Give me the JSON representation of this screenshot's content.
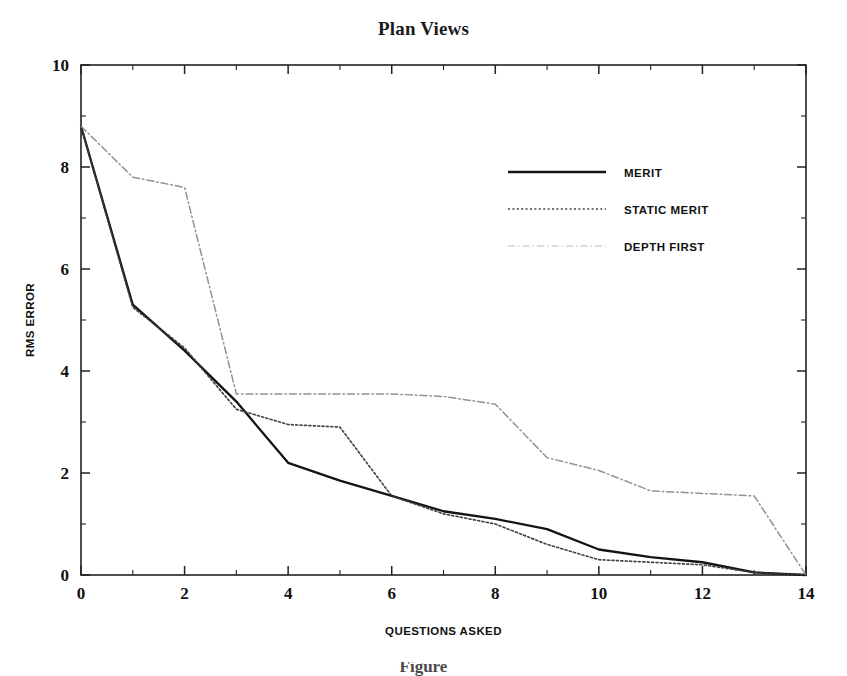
{
  "figure": {
    "title": "Plan Views",
    "caption_partial": "Figure"
  },
  "axes": {
    "x": {
      "label": "QUESTIONS ASKED",
      "ticks": [
        0,
        2,
        4,
        6,
        8,
        10,
        12,
        14
      ],
      "minor_ticks": [
        1,
        3,
        5,
        7,
        9,
        11,
        13
      ],
      "min": 0,
      "max": 14
    },
    "y": {
      "label": "RMS ERROR",
      "ticks": [
        0,
        2,
        4,
        6,
        8,
        10
      ],
      "min": 0,
      "max": 10
    }
  },
  "legend": {
    "position": "upper-right-inside",
    "entries": [
      {
        "label": "MERIT",
        "style": "solid"
      },
      {
        "label": "STATIC MERIT",
        "style": "dotted"
      },
      {
        "label": "DEPTH FIRST",
        "style": "dashdot-faded"
      }
    ]
  },
  "colors": {
    "axis": "#222222",
    "merit": "#141414",
    "static_merit": "#3a3a3a",
    "depth_first": "#8c8c8c",
    "background": "#ffffff"
  },
  "chart_data": {
    "type": "line",
    "title": "Plan Views",
    "xlabel": "QUESTIONS ASKED",
    "ylabel": "RMS ERROR",
    "xlim": [
      0,
      14
    ],
    "ylim": [
      0,
      10
    ],
    "grid": false,
    "legend_position": "upper right",
    "x": [
      0,
      1,
      2,
      3,
      4,
      5,
      6,
      7,
      8,
      9,
      10,
      11,
      12,
      13,
      14
    ],
    "series": [
      {
        "name": "MERIT",
        "style": "solid",
        "values": [
          8.8,
          5.3,
          4.4,
          3.4,
          2.2,
          1.85,
          1.55,
          1.25,
          1.1,
          0.9,
          0.5,
          0.35,
          0.25,
          0.05,
          0.0
        ]
      },
      {
        "name": "STATIC MERIT",
        "style": "dotted",
        "values": [
          8.8,
          5.25,
          4.45,
          3.25,
          2.95,
          2.9,
          1.55,
          1.2,
          1.0,
          0.6,
          0.3,
          0.25,
          0.2,
          0.05,
          0.0
        ]
      },
      {
        "name": "DEPTH FIRST",
        "style": "dashdot",
        "values": [
          8.8,
          7.8,
          7.6,
          3.55,
          3.55,
          3.55,
          3.55,
          3.5,
          3.35,
          2.3,
          2.05,
          1.65,
          1.6,
          1.55,
          0.0
        ]
      }
    ]
  }
}
